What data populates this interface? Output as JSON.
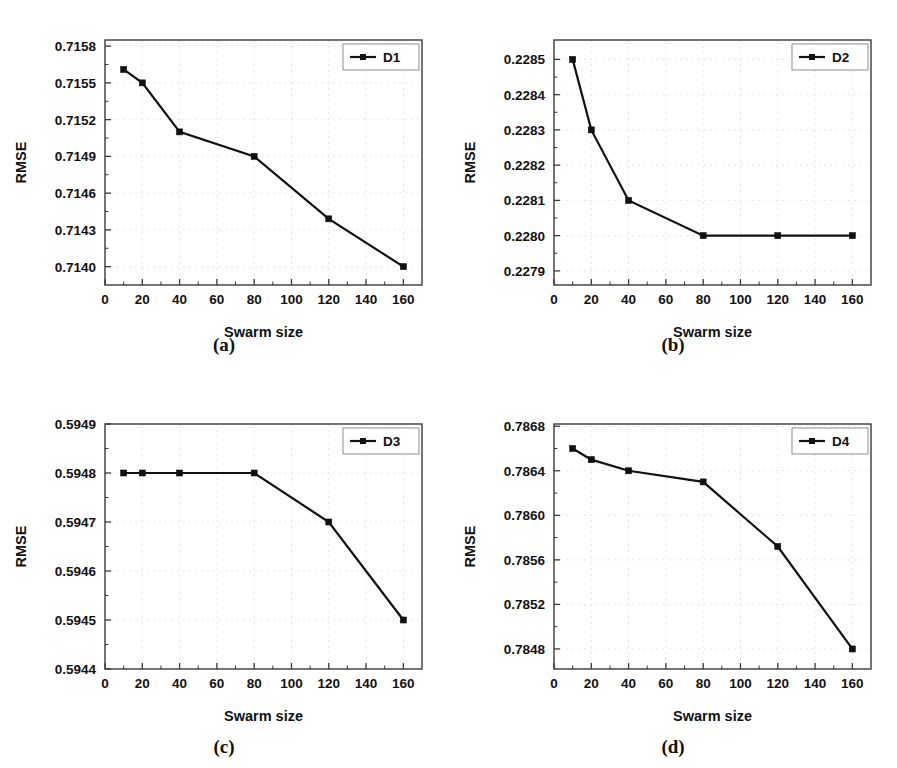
{
  "figure": {
    "background": "#ffffff",
    "series_color": "#111111",
    "grid_color": "#e2e2e6",
    "axis_color": "#3a3a3a",
    "panel_count": 4
  },
  "captions": {
    "a": "(a)",
    "b": "(b)",
    "c": "(c)",
    "d": "(d)"
  },
  "chart_data": [
    {
      "id": "panel-a",
      "type": "line",
      "title": "",
      "xlabel": "Swarm size",
      "ylabel": "RMSE",
      "legend": [
        "D1"
      ],
      "legend_position": "top-right",
      "grid": true,
      "xlim": [
        0,
        170
      ],
      "ylim": [
        0.71385,
        0.71585
      ],
      "xticks": [
        0,
        20,
        40,
        60,
        80,
        100,
        120,
        140,
        160
      ],
      "xticklabels": [
        "0",
        "20",
        "40",
        "60",
        "80",
        "100",
        "120",
        "140",
        "160"
      ],
      "yticks": [
        0.714,
        0.7143,
        0.7146,
        0.7149,
        0.7152,
        0.7155,
        0.7158
      ],
      "yticklabels": [
        "0.7140",
        "0.7143",
        "0.7146",
        "0.7149",
        "0.7152",
        "0.7155",
        "0.7158"
      ],
      "x": [
        10,
        20,
        40,
        80,
        120,
        160
      ],
      "series": [
        {
          "name": "D1",
          "values": [
            0.71561,
            0.7155,
            0.7151,
            0.7149,
            0.71439,
            0.714
          ]
        }
      ]
    },
    {
      "id": "panel-b",
      "type": "line",
      "title": "",
      "xlabel": "Swarm size",
      "ylabel": "RMSE",
      "legend": [
        "D2"
      ],
      "legend_position": "top-right",
      "grid": true,
      "xlim": [
        0,
        170
      ],
      "ylim": [
        0.22786,
        0.228555
      ],
      "xticks": [
        0,
        20,
        40,
        60,
        80,
        100,
        120,
        140,
        160
      ],
      "xticklabels": [
        "0",
        "20",
        "40",
        "60",
        "80",
        "100",
        "120",
        "140",
        "160"
      ],
      "yticks": [
        0.2279,
        0.228,
        0.2281,
        0.2282,
        0.2283,
        0.2284,
        0.2285
      ],
      "yticklabels": [
        "0.2279",
        "0.2280",
        "0.2281",
        "0.2282",
        "0.2283",
        "0.2284",
        "0.2285"
      ],
      "x": [
        10,
        20,
        40,
        80,
        120,
        160
      ],
      "series": [
        {
          "name": "D2",
          "values": [
            0.2285,
            0.2283,
            0.2281,
            0.228,
            0.228,
            0.228
          ]
        }
      ]
    },
    {
      "id": "panel-c",
      "type": "line",
      "title": "",
      "xlabel": "Swarm size",
      "ylabel": "RMSE",
      "legend": [
        "D3"
      ],
      "legend_position": "top-right",
      "grid": true,
      "xlim": [
        0,
        170
      ],
      "ylim": [
        0.5944,
        0.5949
      ],
      "xticks": [
        0,
        20,
        40,
        60,
        80,
        100,
        120,
        140,
        160
      ],
      "xticklabels": [
        "0",
        "20",
        "40",
        "60",
        "80",
        "100",
        "120",
        "140",
        "160"
      ],
      "yticks": [
        0.5944,
        0.5945,
        0.5946,
        0.5947,
        0.5948,
        0.5949
      ],
      "yticklabels": [
        "0.5944",
        "0.5945",
        "0.5946",
        "0.5947",
        "0.5948",
        "0.5949"
      ],
      "x": [
        10,
        20,
        40,
        80,
        120,
        160
      ],
      "series": [
        {
          "name": "D3",
          "values": [
            0.5948,
            0.5948,
            0.5948,
            0.5948,
            0.5947,
            0.5945
          ]
        }
      ]
    },
    {
      "id": "panel-d",
      "type": "line",
      "title": "",
      "xlabel": "Swarm size",
      "ylabel": "RMSE",
      "legend": [
        "D4"
      ],
      "legend_position": "top-right",
      "grid": true,
      "xlim": [
        0,
        170
      ],
      "ylim": [
        0.78462,
        0.78682
      ],
      "xticks": [
        0,
        20,
        40,
        60,
        80,
        100,
        120,
        140,
        160
      ],
      "xticklabels": [
        "0",
        "20",
        "40",
        "60",
        "80",
        "100",
        "120",
        "140",
        "160"
      ],
      "yticks": [
        0.7848,
        0.7852,
        0.7856,
        0.786,
        0.7864,
        0.7868
      ],
      "yticklabels": [
        "0.7848",
        "0.7852",
        "0.7856",
        "0.7860",
        "0.7864",
        "0.7868"
      ],
      "x": [
        10,
        20,
        40,
        80,
        120,
        160
      ],
      "series": [
        {
          "name": "D4",
          "values": [
            0.7866,
            0.7865,
            0.7864,
            0.7863,
            0.78572,
            0.7848
          ]
        }
      ]
    }
  ]
}
